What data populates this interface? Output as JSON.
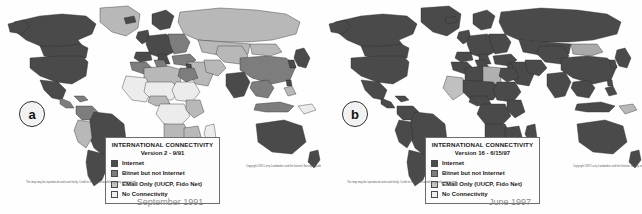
{
  "figure": {
    "title": "",
    "background_color": "#fefefe"
  },
  "colors": {
    "internet": "#4a4a4a",
    "bitnet_not_internet": "#7d7d7d",
    "email_only": "#b8b8b8",
    "no_connectivity": "#ececec",
    "ocean": "#fefefe",
    "border": "#2b2b2b",
    "caption_text": "#8a8a8a",
    "legend_border": "#6d6d6d"
  },
  "panels": [
    {
      "id": "a",
      "letter": "a",
      "caption": "September 1991",
      "legend": {
        "title": "INTERNATIONAL CONNECTIVITY",
        "subtitle": "Version 2 - 9/91",
        "items": [
          {
            "label": "Internet",
            "color": "#4a4a4a"
          },
          {
            "label": "Bitnet but not Internet",
            "color": "#7d7d7d"
          },
          {
            "label": "EMail Only (UUCP, Fido Net)",
            "color": "#c4c4c4"
          },
          {
            "label": "No Connectivity",
            "color": "#f0f0f0"
          }
        ]
      },
      "credit_right": "Copyright 1991 Larry Landweber and the Internet Society unpublished on request to landweber@cs.wisc.edu if the copyright notice",
      "credit_left": "The map may be reproduced and used freely. Credit to the source would be greatly appreciated."
    },
    {
      "id": "b",
      "letter": "b",
      "caption": "June 1997",
      "legend": {
        "title": "INTERNATIONAL CONNECTIVITY",
        "subtitle": "Version 16 - 6/15/97",
        "items": [
          {
            "label": "Internet",
            "color": "#4a4a4a"
          },
          {
            "label": "Bitnet but not Internet",
            "color": "#7d7d7d"
          },
          {
            "label": "EMail Only (UUCP, Fido Net)",
            "color": "#c4c4c4"
          },
          {
            "label": "No Connectivity",
            "color": "#f0f0f0"
          }
        ]
      },
      "credit_right": "Copyright 1997 Larry Landweber and the Internet Society unpublished on request to landweber@cs.wisc.edu if the copyright notice",
      "credit_left": "The map may be reproduced and used freely. Credit to the source would be greatly appreciated."
    }
  ],
  "map_data": {
    "type": "choropleth",
    "projection": "world-equirectangular",
    "categories": [
      "Internet",
      "Bitnet but not Internet",
      "EMail Only (UUCP, Fido Net)",
      "No Connectivity"
    ],
    "panel_a_summary": {
      "Internet": [
        "United States",
        "Canada",
        "Mexico",
        "Brazil",
        "Argentina",
        "Chile",
        "Western Europe",
        "United Kingdom",
        "France",
        "Germany",
        "Italy",
        "Spain",
        "Scandinavia",
        "Japan",
        "South Korea",
        "Australia",
        "New Zealand",
        "India",
        "Israel",
        "South Africa",
        "Taiwan",
        "Greenland"
      ],
      "Bitnet but not Internet": [
        "Poland",
        "Hungary",
        "Czechoslovakia",
        "Venezuela",
        "Colombia",
        "Peru",
        "Turkey",
        "Egypt",
        "Tunisia",
        "China",
        "Thailand",
        "Indonesia"
      ],
      "EMail Only (UUCP, Fido Net)": [
        "Soviet Union",
        "Kazakhstan",
        "Mongolia",
        "Saudi Arabia",
        "Iran",
        "Algeria",
        "Libya",
        "Nigeria",
        "Kenya",
        "Zimbabwe",
        "Bolivia",
        "Ecuador",
        "Malaysia",
        "Philippines"
      ],
      "No Connectivity": [
        "Central Africa",
        "Sudan",
        "Chad",
        "Niger",
        "Mali",
        "Angola",
        "Zaire",
        "Afghanistan",
        "Myanmar",
        "Papua New Guinea",
        "much of sub-Saharan Africa"
      ]
    },
    "panel_b_summary": {
      "Internet": [
        "nearly all of North America",
        "South America",
        "Europe",
        "Russia",
        "China",
        "India",
        "Southeast Asia",
        "Australia",
        "New Zealand",
        "Japan",
        "most of Africa",
        "Middle East"
      ],
      "Bitnet but not Internet": [],
      "EMail Only (UUCP, Fido Net)": [
        "a few Central African states",
        "Libya",
        "Mauritania",
        "Mongolia border regions"
      ],
      "No Connectivity": [
        "isolated small territories"
      ]
    }
  }
}
